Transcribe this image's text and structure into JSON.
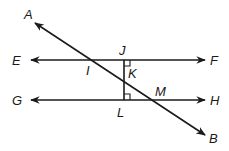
{
  "diagram": {
    "type": "geometry",
    "colors": {
      "stroke": "#1a1a1a",
      "background": "#ffffff"
    },
    "labels": {
      "A": "A",
      "B": "B",
      "E": "E",
      "F": "F",
      "G": "G",
      "H": "H",
      "I": "I",
      "J": "J",
      "K": "K",
      "L": "L",
      "M": "M"
    },
    "lines": [
      {
        "name": "EF",
        "type": "line",
        "arrows": "both"
      },
      {
        "name": "GH",
        "type": "line",
        "arrows": "both"
      },
      {
        "name": "AB",
        "type": "line",
        "arrows": "both",
        "role": "transversal"
      },
      {
        "name": "JL",
        "type": "segment",
        "perpendicular_to": [
          "EF",
          "GH"
        ]
      }
    ],
    "right_angles": [
      "J",
      "L"
    ],
    "intersections": [
      {
        "point": "I",
        "of": [
          "AB",
          "EF"
        ]
      },
      {
        "point": "K",
        "of": [
          "AB",
          "JL"
        ]
      },
      {
        "point": "M",
        "of": [
          "AB",
          "GH"
        ]
      }
    ]
  }
}
